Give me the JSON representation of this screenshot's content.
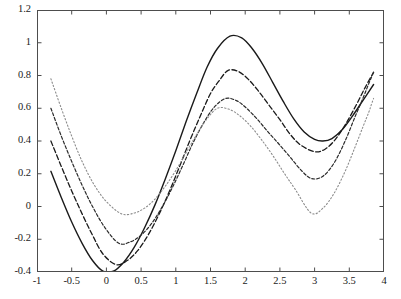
{
  "chart_data": {
    "type": "line",
    "title": "",
    "subtitle": "",
    "xlabel": "",
    "ylabel": "",
    "xlim": [
      -1,
      4
    ],
    "ylim": [
      -0.4,
      1.2
    ],
    "xticks": [
      -1,
      -0.5,
      0,
      0.5,
      1,
      1.5,
      2,
      2.5,
      3,
      3.5,
      4
    ],
    "xtick_labels": [
      "-1",
      "-0.5",
      "0",
      "0.5",
      "1",
      "1.5",
      "2",
      "2.5",
      "3",
      "3.5",
      "4"
    ],
    "yticks": [
      -0.4,
      -0.2,
      0,
      0.2,
      0.4,
      0.6,
      0.8,
      1,
      1.2
    ],
    "ytick_labels": [
      "-0.4",
      "-0.2",
      "0",
      "0.2",
      "0.4",
      "0.6",
      "0.8",
      "1",
      "1.2"
    ],
    "grid": false,
    "legend": "none",
    "box": true,
    "x_data_range": [
      -0.8,
      3.85
    ],
    "series": [
      {
        "name": "curve-1",
        "style": "solid",
        "color": "#1a1a1a",
        "width": 1.4,
        "dash": "none",
        "peak_x": 1.78,
        "peak_y": 1.04,
        "min_left_x": 0.02,
        "min_left_y": -0.4,
        "min_right_x": 3.12,
        "min_right_y": 0.4,
        "start_y": 0.215,
        "end_y": 0.745,
        "x": [
          -0.8,
          -0.65,
          -0.5,
          -0.35,
          -0.2,
          -0.05,
          0.1,
          0.25,
          0.4,
          0.55,
          0.7,
          0.85,
          1.0,
          1.15,
          1.3,
          1.45,
          1.6,
          1.78,
          1.95,
          2.1,
          2.25,
          2.4,
          2.55,
          2.7,
          2.85,
          3.0,
          3.12,
          3.25,
          3.4,
          3.55,
          3.7,
          3.85
        ],
        "y": [
          0.215,
          0.055,
          -0.095,
          -0.225,
          -0.33,
          -0.395,
          -0.395,
          -0.34,
          -0.25,
          -0.13,
          0.01,
          0.17,
          0.34,
          0.52,
          0.69,
          0.85,
          0.965,
          1.04,
          1.03,
          0.965,
          0.87,
          0.755,
          0.64,
          0.535,
          0.455,
          0.41,
          0.4,
          0.415,
          0.47,
          0.555,
          0.65,
          0.745
        ]
      },
      {
        "name": "curve-2",
        "style": "dashed",
        "color": "#1a1a1a",
        "width": 1.3,
        "dash": "5,2.5",
        "peak_x": 1.75,
        "peak_y": 0.83,
        "min_left_x": 0.14,
        "min_left_y": -0.355,
        "min_right_x": 3.0,
        "min_right_y": 0.335,
        "start_y": 0.4,
        "end_y": 0.82,
        "x": [
          -0.8,
          -0.65,
          -0.5,
          -0.35,
          -0.2,
          -0.05,
          0.14,
          0.3,
          0.45,
          0.6,
          0.75,
          0.9,
          1.05,
          1.2,
          1.35,
          1.5,
          1.62,
          1.75,
          1.9,
          2.05,
          2.2,
          2.35,
          2.5,
          2.65,
          2.8,
          3.0,
          3.15,
          3.3,
          3.45,
          3.6,
          3.72,
          3.85
        ],
        "y": [
          0.4,
          0.245,
          0.095,
          -0.045,
          -0.175,
          -0.29,
          -0.355,
          -0.33,
          -0.27,
          -0.175,
          -0.055,
          0.085,
          0.24,
          0.4,
          0.55,
          0.69,
          0.765,
          0.83,
          0.825,
          0.775,
          0.7,
          0.615,
          0.53,
          0.44,
          0.375,
          0.335,
          0.35,
          0.41,
          0.505,
          0.62,
          0.72,
          0.82
        ]
      },
      {
        "name": "curve-3",
        "style": "dash-dot",
        "color": "#2a2a2a",
        "width": 1.2,
        "dash": "3,2",
        "peak_x": 1.72,
        "peak_y": 0.66,
        "min_left_x": 0.18,
        "min_left_y": -0.225,
        "min_right_x": 2.96,
        "min_right_y": 0.17,
        "start_y": 0.6,
        "end_y": 0.82,
        "x": [
          -0.8,
          -0.65,
          -0.5,
          -0.35,
          -0.2,
          -0.02,
          0.18,
          0.35,
          0.5,
          0.65,
          0.8,
          0.95,
          1.1,
          1.25,
          1.4,
          1.55,
          1.72,
          1.88,
          2.02,
          2.18,
          2.34,
          2.5,
          2.66,
          2.82,
          2.96,
          3.12,
          3.28,
          3.44,
          3.58,
          3.7,
          3.78,
          3.85
        ],
        "y": [
          0.6,
          0.43,
          0.275,
          0.13,
          0.0,
          -0.13,
          -0.225,
          -0.215,
          -0.175,
          -0.105,
          -0.005,
          0.115,
          0.25,
          0.39,
          0.51,
          0.605,
          0.66,
          0.645,
          0.6,
          0.53,
          0.45,
          0.375,
          0.295,
          0.215,
          0.17,
          0.185,
          0.265,
          0.4,
          0.545,
          0.665,
          0.75,
          0.82
        ]
      },
      {
        "name": "curve-4",
        "style": "dotted",
        "color": "#8c8c8c",
        "width": 1.1,
        "dash": "1.3,2.2",
        "peak_x": 1.6,
        "peak_y": 0.6,
        "min_left_x": 0.22,
        "min_left_y": -0.045,
        "min_right_x": 2.95,
        "min_right_y": -0.04,
        "start_y": 0.78,
        "end_y": 0.66,
        "x": [
          -0.8,
          -0.65,
          -0.5,
          -0.35,
          -0.18,
          0.0,
          0.22,
          0.4,
          0.55,
          0.7,
          0.85,
          1.0,
          1.15,
          1.3,
          1.45,
          1.6,
          1.76,
          1.92,
          2.08,
          2.24,
          2.4,
          2.56,
          2.72,
          2.95,
          3.12,
          3.28,
          3.44,
          3.58,
          3.7,
          3.78,
          3.82,
          3.85
        ],
        "y": [
          0.78,
          0.6,
          0.43,
          0.275,
          0.135,
          0.03,
          -0.045,
          -0.04,
          -0.01,
          0.045,
          0.125,
          0.22,
          0.33,
          0.44,
          0.535,
          0.6,
          0.595,
          0.555,
          0.49,
          0.405,
          0.31,
          0.205,
          0.105,
          -0.04,
          -0.01,
          0.08,
          0.215,
          0.36,
          0.49,
          0.575,
          0.625,
          0.66
        ]
      }
    ]
  },
  "axes": {
    "frame_color": "#4d4d4d",
    "tick_color": "#4d4d4d",
    "background": "#ffffff"
  }
}
